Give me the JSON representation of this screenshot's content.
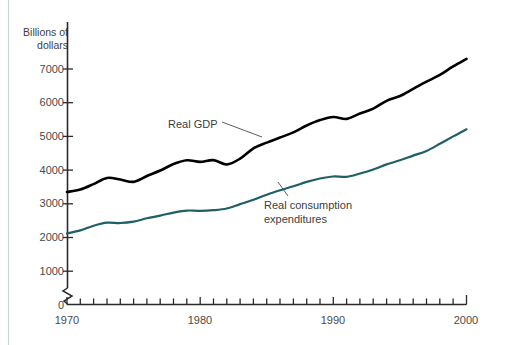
{
  "chart_data": {
    "type": "line",
    "title": "",
    "subtitle": "",
    "xlabel": "",
    "ylabel": "Billions of\ndollars",
    "ylabel_line1": "Billions of",
    "ylabel_line2": "dollars",
    "xlim": [
      1970,
      2000
    ],
    "ylim": [
      0,
      7500
    ],
    "y_axis_break": true,
    "y_axis_break_note": "zig-zag break between 0 and 1000",
    "grid": false,
    "legend_position": "inline-annotations",
    "yticks": [
      0,
      1000,
      2000,
      3000,
      4000,
      5000,
      6000,
      7000
    ],
    "ytick_labels": [
      "0",
      "1000",
      "2000",
      "3000",
      "4000",
      "5000",
      "6000",
      "7000"
    ],
    "xticks": [
      1970,
      1971,
      1972,
      1973,
      1974,
      1975,
      1976,
      1977,
      1978,
      1979,
      1980,
      1981,
      1982,
      1983,
      1984,
      1985,
      1986,
      1987,
      1988,
      1989,
      1990,
      1991,
      1992,
      1993,
      1994,
      1995,
      1996,
      1997,
      1998,
      1999,
      2000
    ],
    "xtick_labels_shown": [
      "1970",
      "1980",
      "1990",
      "2000"
    ],
    "x": [
      1970,
      1971,
      1972,
      1973,
      1974,
      1975,
      1976,
      1977,
      1978,
      1979,
      1980,
      1981,
      1982,
      1983,
      1984,
      1985,
      1986,
      1987,
      1988,
      1989,
      1990,
      1991,
      1992,
      1993,
      1994,
      1995,
      1996,
      1997,
      1998,
      1999,
      2000
    ],
    "series": [
      {
        "name": "Real GDP",
        "color": "#000000",
        "values": [
          3350,
          3450,
          3640,
          3850,
          3830,
          3790,
          3990,
          4180,
          4400,
          4540,
          4520,
          4600,
          4500,
          4700,
          5030,
          5230,
          5410,
          5590,
          5820,
          6010,
          6130,
          6100,
          6290,
          6460,
          6720,
          6890,
          7130,
          7370,
          7600,
          7880,
          8130
        ],
        "values_as_drawn": [
          3350,
          3450,
          3640,
          3850,
          3830,
          3790,
          3990,
          4180,
          4400,
          4540,
          4520,
          4600,
          4500,
          4700,
          5030,
          5230,
          5410,
          5590,
          5820,
          6010,
          6130,
          6100,
          6290,
          6460,
          6720,
          6890,
          7130,
          7370,
          7600,
          7880,
          8130
        ]
      },
      {
        "name": "Real consumption\nexpenditures",
        "color": "#1f5f66",
        "values": [
          2120,
          2210,
          2350,
          2440,
          2430,
          2470,
          2570,
          2650,
          2740,
          2800,
          2790,
          2810,
          2860,
          2990,
          3120,
          3270,
          3400,
          3520,
          3650,
          3750,
          3810,
          3800,
          3900,
          4020,
          4170,
          4290,
          4430,
          4570,
          4780,
          5000,
          5210
        ]
      }
    ],
    "annotations": [
      {
        "text": "Real GDP",
        "series": "Real GDP"
      },
      {
        "text": "Real consumption\nexpenditures",
        "series": "Real consumption expenditures"
      }
    ]
  },
  "labels": {
    "y_axis_title_line1": "Billions of",
    "y_axis_title_line2": "dollars",
    "gdp_label": "Real GDP",
    "consumption_label_line1": "Real consumption",
    "consumption_label_line2": "expenditures",
    "y_0": "0",
    "y_1000": "1000",
    "y_2000": "2000",
    "y_3000": "3000",
    "y_4000": "4000",
    "y_5000": "5000",
    "y_6000": "6000",
    "y_7000": "7000",
    "x_1970": "1970",
    "x_1980": "1980",
    "x_1990": "1990",
    "x_2000": "2000"
  },
  "colors": {
    "gdp_line": "#000000",
    "consumption_line": "#1f5f66",
    "axis": "#2b2b2b",
    "text": "#4a4a4a",
    "rule": "#c8d6d4",
    "background": "#ffffff"
  }
}
